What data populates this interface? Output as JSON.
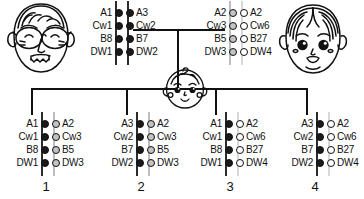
{
  "diagram": {
    "type": "pedigree",
    "loci": [
      "A",
      "Cw",
      "B",
      "DW"
    ],
    "colors": {
      "paternal_haplotype_a": "#1a1a1a",
      "paternal_haplotype_b": "#1a1a1a",
      "maternal_haplotype_c": "#c3c3c3",
      "maternal_haplotype_d": "#ffffff",
      "line": "#111111"
    }
  },
  "father": {
    "role": "father",
    "icon": "father-face-with-glasses",
    "haplotype_left": {
      "name": "a",
      "fill": "dark",
      "alleles": [
        "A1",
        "Cw1",
        "B8",
        "DW1"
      ]
    },
    "haplotype_right": {
      "name": "b",
      "fill": "dark",
      "alleles": [
        "A3",
        "Cw2",
        "B7",
        "DW2"
      ]
    }
  },
  "mother": {
    "role": "mother",
    "icon": "mother-face",
    "haplotype_left": {
      "name": "c",
      "fill": "grey",
      "alleles": [
        "A2",
        "Cw3",
        "B5",
        "DW3"
      ]
    },
    "haplotype_right": {
      "name": "d",
      "fill": "light",
      "alleles": [
        "A2",
        "Cw6",
        "B27",
        "DW4"
      ]
    }
  },
  "baby_icon": "baby-face",
  "children": [
    {
      "index": "1",
      "haplotypes": "a/c",
      "left": {
        "fill": "dark",
        "alleles": [
          "A1",
          "Cw1",
          "B8",
          "DW1"
        ]
      },
      "right": {
        "fill": "grey",
        "alleles": [
          "A2",
          "Cw3",
          "B5",
          "DW3"
        ]
      }
    },
    {
      "index": "2",
      "haplotypes": "b/c",
      "left": {
        "fill": "dark",
        "alleles": [
          "A3",
          "Cw2",
          "B7",
          "DW2"
        ]
      },
      "right": {
        "fill": "grey",
        "alleles": [
          "A2",
          "Cw3",
          "B5",
          "DW3"
        ]
      }
    },
    {
      "index": "3",
      "haplotypes": "a/d",
      "left": {
        "fill": "dark",
        "alleles": [
          "A1",
          "Cw1",
          "B8",
          "DW1"
        ]
      },
      "right": {
        "fill": "light",
        "alleles": [
          "A2",
          "Cw6",
          "B27",
          "DW4"
        ]
      }
    },
    {
      "index": "4",
      "haplotypes": "b/d",
      "left": {
        "fill": "dark",
        "alleles": [
          "A3",
          "Cw2",
          "B7",
          "DW2"
        ]
      },
      "right": {
        "fill": "light",
        "alleles": [
          "A2",
          "Cw6",
          "B27",
          "DW4"
        ]
      }
    }
  ]
}
